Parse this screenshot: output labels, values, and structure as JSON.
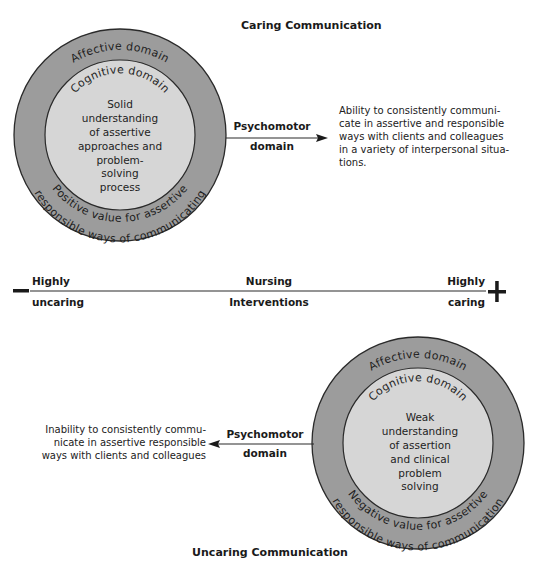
{
  "caring": {
    "title": "Caring Communication",
    "outer_label": "Affective domain",
    "inner_label": "Cognitive domain",
    "center_lines": [
      "Solid",
      "understanding",
      "of assertive",
      "approaches and",
      "problem-",
      "solving",
      "process"
    ],
    "bottom_arc_1": "Positive value for assertive",
    "bottom_arc_2": "responsible ways of communicating",
    "arrow_label_1": "Psychomotor",
    "arrow_label_2": "domain",
    "outcome_lines": [
      "Ability to consistently communi-",
      "cate in assertive and responsible",
      "ways with clients and colleagues",
      "in a variety of interpersonal situa-",
      "tions."
    ]
  },
  "continuum": {
    "minus_sign": "−",
    "plus_sign": "+",
    "left_top": "Highly",
    "left_bottom": "uncaring",
    "center_top": "Nursing",
    "center_bottom": "Interventions",
    "right_top": "Highly",
    "right_bottom": "caring"
  },
  "uncaring": {
    "title": "Uncaring Communication",
    "outer_label": "Affective domain",
    "inner_label": "Cognitive domain",
    "center_lines": [
      "Weak",
      "understanding",
      "of assertion",
      "and clinical",
      "problem",
      "solving"
    ],
    "bottom_arc_1": "Negative value for assertive",
    "bottom_arc_2": "responsible ways of communication",
    "arrow_label_1": "Psychomotor",
    "arrow_label_2": "domain",
    "outcome_lines": [
      "Inability to consistently commu-",
      "nicate in assertive responsible",
      "ways with clients and colleagues"
    ]
  },
  "colors": {
    "outer_ring": "#9c9c9c",
    "inner_circle": "#d6d6d6",
    "ink": "#1a1a1a"
  }
}
